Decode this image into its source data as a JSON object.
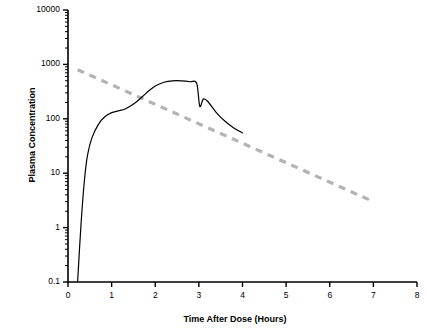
{
  "chart_data": {
    "type": "line",
    "title": "",
    "xlabel": "Time After Dose (Hours)",
    "ylabel": "Plasma Concentration",
    "xlim": [
      0,
      8
    ],
    "ylim": [
      0.1,
      10000
    ],
    "yscale": "log",
    "grid": false,
    "legend": null,
    "x_ticks": [
      "0",
      "1",
      "2",
      "3",
      "4",
      "5",
      "6",
      "7",
      "8"
    ],
    "y_ticks": [
      "0.1",
      "1",
      "10",
      "100",
      "1000",
      "10000"
    ],
    "series": [
      {
        "name": "Plasma concentration profile",
        "style": "solid",
        "color": "#000000",
        "points": [
          [
            0.22,
            0.1
          ],
          [
            0.3,
            1.2
          ],
          [
            0.38,
            8
          ],
          [
            0.45,
            22
          ],
          [
            0.55,
            45
          ],
          [
            0.7,
            80
          ],
          [
            0.85,
            110
          ],
          [
            1.0,
            130
          ],
          [
            1.15,
            140
          ],
          [
            1.3,
            150
          ],
          [
            1.45,
            175
          ],
          [
            1.6,
            215
          ],
          [
            1.8,
            300
          ],
          [
            2.0,
            400
          ],
          [
            2.2,
            470
          ],
          [
            2.4,
            500
          ],
          [
            2.6,
            500
          ],
          [
            2.8,
            480
          ],
          [
            2.95,
            450
          ],
          [
            3.02,
            170
          ],
          [
            3.1,
            230
          ],
          [
            3.2,
            210
          ],
          [
            3.4,
            130
          ],
          [
            3.6,
            90
          ],
          [
            3.8,
            68
          ],
          [
            4.0,
            55
          ]
        ]
      },
      {
        "name": "Terminal elimination reference line",
        "style": "dashed",
        "color": "#b3b3b3",
        "points": [
          [
            0.22,
            800
          ],
          [
            7.0,
            3.0
          ]
        ]
      }
    ]
  },
  "axes": {
    "x_title": "Time After Dose (Hours)",
    "y_title": "Plasma Concentration"
  }
}
